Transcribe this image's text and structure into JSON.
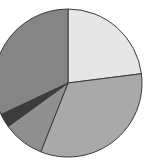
{
  "chart_data": {
    "type": "pie",
    "title": "",
    "start_angle_deg": 0,
    "direction": "clockwise",
    "legend": "none",
    "slices": [
      {
        "label": "",
        "value": 23,
        "color": "#e6e6e6"
      },
      {
        "label": "",
        "value": 33,
        "color": "#a9a9a9"
      },
      {
        "label": "",
        "value": 9,
        "color": "#8f8f8f"
      },
      {
        "label": "",
        "value": 3,
        "color": "#3c3c3c"
      },
      {
        "label": "",
        "value": 32,
        "color": "#858585"
      }
    ],
    "center": [
      68,
      83
    ],
    "radius": 74,
    "stroke": "#3a3a3a"
  }
}
